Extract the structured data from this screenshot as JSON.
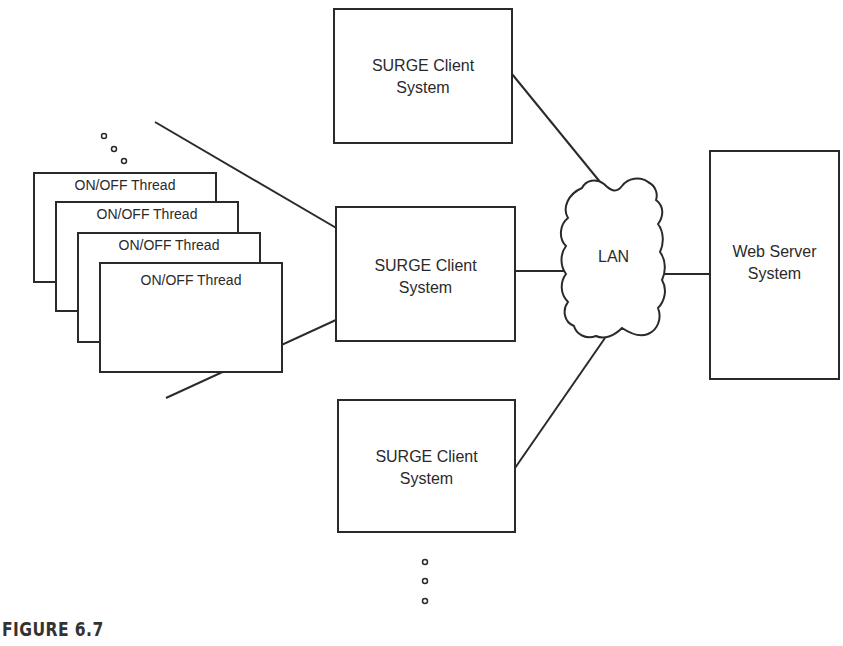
{
  "figure": {
    "caption": "FIGURE 6.7"
  },
  "threads": [
    {
      "label": "ON/OFF Thread"
    },
    {
      "label": "ON/OFF Thread"
    },
    {
      "label": "ON/OFF Thread"
    },
    {
      "label": "ON/OFF Thread"
    }
  ],
  "clients": [
    {
      "line1": "SURGE Client",
      "line2": "System"
    },
    {
      "line1": "SURGE Client",
      "line2": "System"
    },
    {
      "line1": "SURGE Client",
      "line2": "System"
    }
  ],
  "network": {
    "label": "LAN"
  },
  "server": {
    "line1": "Web Server",
    "line2": "System"
  },
  "ellipsis": {
    "threads": "more threads (3 dots)",
    "clients": "more clients (3 dots)"
  },
  "colors": {
    "stroke": "#2a2a2a",
    "background": "#ffffff"
  }
}
